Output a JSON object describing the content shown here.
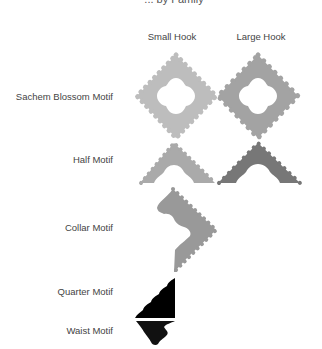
{
  "title_partial": "... by Family",
  "columns": [
    {
      "label": "Small Hook",
      "x": 172
    },
    {
      "label": "Large Hook",
      "x": 261
    }
  ],
  "rows": [
    {
      "label": "Sachem Blossom Motif",
      "y": 96
    },
    {
      "label": "Half Motif",
      "y": 159
    },
    {
      "label": "Collar Motif",
      "y": 227
    },
    {
      "label": "Quarter Motif",
      "y": 291
    },
    {
      "label": "Waist Motif",
      "y": 330
    }
  ],
  "colors": {
    "sachem_small": "#bdbdbd",
    "sachem_large": "#a3a3a3",
    "half_small": "#aaaaaa",
    "half_large": "#777777",
    "collar": "#999999",
    "quarter": "#000000",
    "waist": "#111111"
  }
}
